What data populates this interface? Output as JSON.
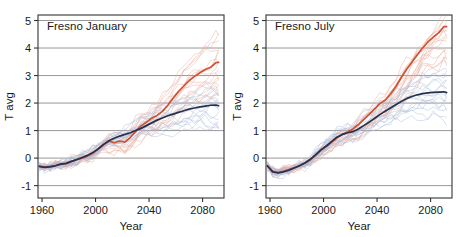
{
  "figure": {
    "background_color": "#ffffff",
    "width": 457,
    "height": 237
  },
  "chart_data": [
    {
      "type": "line",
      "title": "Fresno January",
      "xlabel": "Year",
      "ylabel": "T avg",
      "xlim": [
        1957,
        2096
      ],
      "ylim": [
        -1.45,
        5.2
      ],
      "xticks": [
        1960,
        2000,
        2040,
        2080
      ],
      "xtick_labels": [
        "1960",
        "2000",
        "2040",
        "2080"
      ],
      "yticks": [
        -1,
        0,
        1,
        2,
        3,
        4,
        5
      ],
      "ytick_labels": [
        "-1",
        "0",
        "1",
        "2",
        "3",
        "4",
        "5"
      ],
      "grid": "horizontal",
      "legend": "none",
      "colors": {
        "high_scenario_mean": "#d1502f",
        "low_scenario_mean": "#26304f",
        "high_scenario_members": "#e8a898",
        "low_scenario_members": "#a8b8d8"
      },
      "series": [
        {
          "name": "High emissions ensemble mean",
          "color": "#d1502f",
          "x": [
            1958,
            1962,
            1966,
            1970,
            1974,
            1978,
            1982,
            1986,
            1990,
            1994,
            1998,
            2002,
            2006,
            2010,
            2014,
            2018,
            2022,
            2026,
            2030,
            2034,
            2038,
            2042,
            2046,
            2050,
            2054,
            2058,
            2062,
            2066,
            2070,
            2074,
            2078,
            2082,
            2086,
            2090,
            2092
          ],
          "values": [
            -0.3,
            -0.33,
            -0.3,
            -0.27,
            -0.22,
            -0.2,
            -0.12,
            -0.06,
            0.0,
            0.08,
            0.18,
            0.33,
            0.48,
            0.62,
            0.56,
            0.62,
            0.58,
            0.75,
            0.97,
            1.17,
            1.3,
            1.45,
            1.55,
            1.7,
            1.92,
            2.18,
            2.42,
            2.62,
            2.82,
            2.97,
            3.1,
            3.22,
            3.3,
            3.47,
            3.48
          ]
        },
        {
          "name": "Low emissions ensemble mean",
          "color": "#26304f",
          "x": [
            1958,
            1962,
            1966,
            1970,
            1974,
            1978,
            1982,
            1986,
            1990,
            1994,
            1998,
            2002,
            2006,
            2010,
            2014,
            2018,
            2022,
            2026,
            2030,
            2034,
            2038,
            2042,
            2046,
            2050,
            2054,
            2058,
            2062,
            2066,
            2070,
            2074,
            2078,
            2082,
            2086,
            2090,
            2092
          ],
          "values": [
            -0.3,
            -0.34,
            -0.32,
            -0.28,
            -0.22,
            -0.19,
            -0.12,
            -0.05,
            0.02,
            0.1,
            0.2,
            0.34,
            0.5,
            0.63,
            0.72,
            0.8,
            0.86,
            0.92,
            1.0,
            1.08,
            1.18,
            1.28,
            1.38,
            1.46,
            1.54,
            1.6,
            1.66,
            1.72,
            1.78,
            1.82,
            1.86,
            1.89,
            1.92,
            1.93,
            1.9
          ]
        }
      ],
      "ensemble_member_count": 16,
      "ensemble_spread_2090": {
        "high_min": 2.1,
        "high_max": 4.5,
        "low_min": 1.0,
        "low_max": 2.6
      }
    },
    {
      "type": "line",
      "title": "Fresno July",
      "xlabel": "Year",
      "ylabel": "T avg",
      "xlim": [
        1957,
        2096
      ],
      "ylim": [
        -1.45,
        5.2
      ],
      "xticks": [
        1960,
        2000,
        2040,
        2080
      ],
      "xtick_labels": [
        "1960",
        "2000",
        "2040",
        "2080"
      ],
      "yticks": [
        -1,
        0,
        1,
        2,
        3,
        4,
        5
      ],
      "ytick_labels": [
        "-1",
        "0",
        "1",
        "2",
        "3",
        "4",
        "5"
      ],
      "grid": "horizontal",
      "legend": "none",
      "colors": {
        "high_scenario_mean": "#d1502f",
        "low_scenario_mean": "#26304f",
        "high_scenario_members": "#e8a898",
        "low_scenario_members": "#a8b8d8"
      },
      "series": [
        {
          "name": "High emissions ensemble mean",
          "color": "#d1502f",
          "x": [
            1958,
            1962,
            1966,
            1970,
            1974,
            1978,
            1982,
            1986,
            1990,
            1994,
            1998,
            2002,
            2006,
            2010,
            2014,
            2018,
            2022,
            2026,
            2030,
            2034,
            2038,
            2042,
            2046,
            2050,
            2054,
            2058,
            2062,
            2066,
            2070,
            2074,
            2078,
            2082,
            2086,
            2090,
            2092
          ],
          "values": [
            -0.28,
            -0.48,
            -0.52,
            -0.48,
            -0.42,
            -0.35,
            -0.28,
            -0.18,
            -0.06,
            0.1,
            0.28,
            0.42,
            0.58,
            0.74,
            0.86,
            0.95,
            1.06,
            1.22,
            1.4,
            1.58,
            1.78,
            1.98,
            2.1,
            2.32,
            2.6,
            2.92,
            3.22,
            3.48,
            3.75,
            4.0,
            4.22,
            4.4,
            4.55,
            4.78,
            4.78
          ]
        },
        {
          "name": "Low emissions ensemble mean",
          "color": "#26304f",
          "x": [
            1958,
            1962,
            1966,
            1970,
            1974,
            1978,
            1982,
            1986,
            1990,
            1994,
            1998,
            2002,
            2006,
            2010,
            2014,
            2018,
            2022,
            2026,
            2030,
            2034,
            2038,
            2042,
            2046,
            2050,
            2054,
            2058,
            2062,
            2066,
            2070,
            2074,
            2078,
            2082,
            2086,
            2090,
            2092
          ],
          "values": [
            -0.28,
            -0.5,
            -0.54,
            -0.5,
            -0.44,
            -0.36,
            -0.28,
            -0.18,
            -0.05,
            0.12,
            0.3,
            0.44,
            0.6,
            0.76,
            0.86,
            0.92,
            0.96,
            1.06,
            1.18,
            1.3,
            1.44,
            1.58,
            1.7,
            1.82,
            1.94,
            2.06,
            2.16,
            2.24,
            2.3,
            2.34,
            2.37,
            2.39,
            2.4,
            2.41,
            2.38
          ]
        }
      ],
      "ensemble_member_count": 16,
      "ensemble_spread_2090": {
        "high_min": 3.4,
        "high_max": 5.2,
        "low_min": 1.4,
        "low_max": 3.2
      }
    }
  ]
}
